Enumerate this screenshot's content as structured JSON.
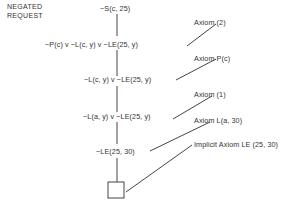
{
  "title_label": {
    "line1": "NEGATED",
    "line2": "REQUEST"
  },
  "resolution_steps": [
    "~S(c, 25)",
    "~P(c) v ~L(c, y) v ~LE(25, y)",
    "~L(c, y) v ~LE(25, y)",
    "~L(a, y) v ~LE(25, y)",
    "~LE(25, 30)"
  ],
  "axioms": [
    "Axiom (2)",
    "Axiom P(c)",
    "Axiom (1)",
    "Axiom L(a, 30)",
    "Implicit Axiom LE (25, 30)"
  ],
  "terminal": {
    "symbol": "empty-clause-box"
  },
  "colors": {
    "line": "#444444",
    "text": "#333333",
    "background": "#ffffff"
  }
}
